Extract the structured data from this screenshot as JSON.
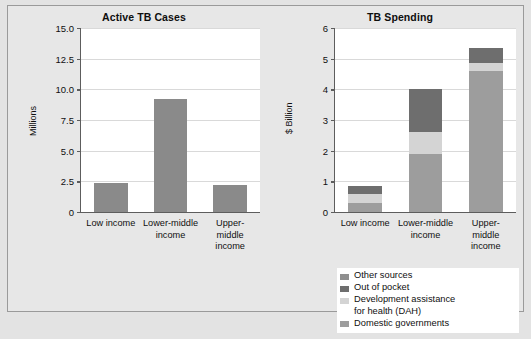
{
  "figure": {
    "background_color": "#e3e3e3",
    "panel_background": "#ffffff"
  },
  "colors": {
    "other_sources": "#8f8f8f",
    "out_of_pocket": "#6e6e6e",
    "dah": "#d4d4d4",
    "domestic_governments": "#9d9d9d",
    "cases_bar": "#8a8a8a",
    "axis": "#5d5d5d",
    "grid": "#d9d9d9"
  },
  "legend": {
    "position": "bottom-right",
    "items": [
      {
        "label": "Other sources",
        "color": "#8f8f8f"
      },
      {
        "label": "Out of pocket",
        "color": "#6e6e6e"
      },
      {
        "label": "Development assistance\nfor health (DAH)",
        "color": "#d4d4d4"
      },
      {
        "label": "Domestic governments",
        "color": "#9d9d9d"
      }
    ]
  },
  "chart_data": [
    {
      "type": "bar",
      "title": "Active TB Cases",
      "xlabel": "",
      "ylabel": "Millions",
      "ylim": [
        0,
        15.0
      ],
      "yticks": [
        "0",
        "2.5",
        "5.0",
        "7.5",
        "10.0",
        "12.5",
        "15.0"
      ],
      "ytick_values": [
        0,
        2.5,
        5.0,
        7.5,
        10.0,
        12.5,
        15.0
      ],
      "grid": true,
      "categories": [
        "Low income",
        "Lower-middle\nincome",
        "Upper-middle\nincome"
      ],
      "values": [
        2.4,
        9.2,
        2.2
      ]
    },
    {
      "type": "bar",
      "subtype": "stacked",
      "title": "TB Spending",
      "xlabel": "",
      "ylabel": "$ Billion",
      "ylim": [
        0,
        6
      ],
      "yticks": [
        "0",
        "1",
        "2",
        "3",
        "4",
        "5",
        "6"
      ],
      "ytick_values": [
        0,
        1,
        2,
        3,
        4,
        5,
        6
      ],
      "grid": true,
      "categories": [
        "Low income",
        "Lower-middle\nincome",
        "Upper-middle\nincome"
      ],
      "series": [
        {
          "name": "Domestic governments",
          "color": "#9d9d9d",
          "values": [
            0.3,
            1.88,
            4.6
          ]
        },
        {
          "name": "Development assistance for health (DAH)",
          "color": "#d4d4d4",
          "values": [
            0.3,
            0.72,
            0.25
          ]
        },
        {
          "name": "Out of pocket",
          "color": "#6e6e6e",
          "values": [
            0.25,
            1.4,
            0.5
          ]
        },
        {
          "name": "Other sources",
          "color": "#8f8f8f",
          "values": [
            0.0,
            0.0,
            0.0
          ]
        }
      ],
      "totals": [
        0.85,
        4.0,
        5.35
      ]
    }
  ]
}
